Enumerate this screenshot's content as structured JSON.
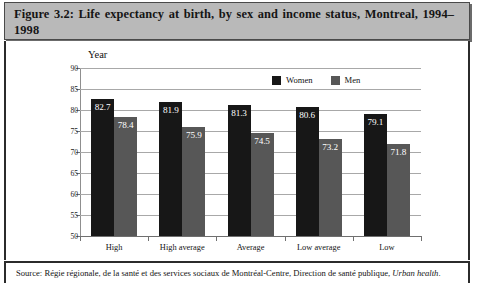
{
  "figure": {
    "title": "Figure 3.2: Life expectancy at birth, by sex and income status, Montreal, 1994–1998",
    "source_prefix": "Source: Régie régionale, de la santé et des services sociaux de Montréal-Centre, Direction de santé publique, ",
    "source_italic": "Urban health",
    "source_suffix": "."
  },
  "colors": {
    "women": "#171717",
    "men": "#575757",
    "title_banner": "#b9b9b9",
    "gridline": "#a8a8a8",
    "frame": "#2b2b2b"
  },
  "chart_data": {
    "type": "bar",
    "title": "Life expectancy at birth, by sex and income status, Montreal, 1994–1998",
    "xlabel": "",
    "ylabel": "Year",
    "axis_caption": "Year",
    "categories": [
      "High",
      "High average",
      "Average",
      "Low average",
      "Low"
    ],
    "series": [
      {
        "name": "Women",
        "color": "#171717",
        "values": [
          82.7,
          81.9,
          81.3,
          80.6,
          79.1
        ]
      },
      {
        "name": "Men",
        "color": "#575757",
        "values": [
          78.4,
          75.9,
          74.5,
          73.2,
          71.8
        ]
      }
    ],
    "ylim": [
      50,
      90
    ],
    "yticks": [
      90,
      85,
      80,
      75,
      70,
      65,
      60,
      55,
      50
    ],
    "ytick_labels": [
      "90",
      "85",
      "80",
      "75",
      "70",
      "65",
      "60",
      "55",
      "50"
    ],
    "grid": true,
    "legend": [
      "Women",
      "Men"
    ],
    "legend_position": "top-right-inside",
    "data_labels": true
  }
}
